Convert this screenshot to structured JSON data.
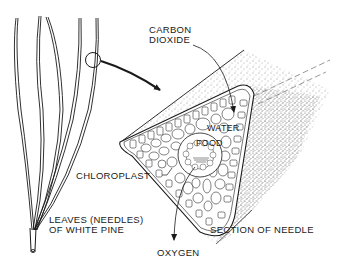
{
  "diagram": {
    "labels": {
      "carbon_dioxide_line1": "CARBON",
      "carbon_dioxide_line2": "DIOXIDE",
      "water": "WATER",
      "food": "FOOD",
      "chloroplast": "CHLOROPLAST",
      "leaves_line1": "LEAVES (NEEDLES)",
      "leaves_line2": "OF WHITE PINE",
      "oxygen": "OXYGEN",
      "section": "SECTION OF NEEDLE"
    },
    "parts": [
      {
        "id": "pine-needles",
        "description": "Cluster of five long white pine needles joined at a sheath"
      },
      {
        "id": "magnifier-circle",
        "description": "Circle highlighting a portion of one needle"
      },
      {
        "id": "zoom-arrow",
        "description": "Arrow from circle to the cross-section"
      },
      {
        "id": "needle-section",
        "description": "Triangular cross-section of needle showing cells, stippled cylindrical body"
      },
      {
        "id": "co2-arrow",
        "description": "Arrow showing carbon dioxide entering the needle"
      },
      {
        "id": "oxygen-arrow",
        "description": "Arrow showing oxygen leaving the needle"
      }
    ],
    "colors": {
      "ink": "#1a1a1a",
      "background": "#ffffff"
    }
  }
}
